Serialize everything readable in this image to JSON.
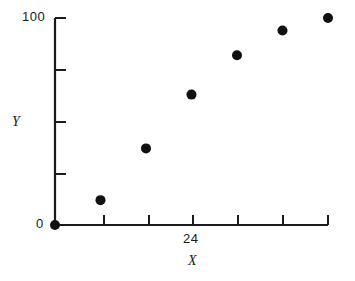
{
  "chart_data": {
    "type": "scatter",
    "title": "",
    "xlabel": "X",
    "ylabel": "Y",
    "xlim": [
      0,
      48
    ],
    "ylim": [
      0,
      100
    ],
    "grid": false,
    "legend": null,
    "x_tick_values": [
      0,
      8,
      16,
      24,
      32,
      40,
      48
    ],
    "x_tick_labels": [
      "",
      "",
      "",
      "24",
      "",
      "",
      ""
    ],
    "y_tick_values": [
      0,
      25,
      50,
      75,
      100
    ],
    "y_tick_labels": [
      "0",
      "",
      "",
      "",
      "100"
    ],
    "x": [
      0,
      8,
      16,
      24,
      32,
      40,
      48
    ],
    "y": [
      0,
      12,
      37,
      63,
      82,
      94,
      100
    ],
    "marker": "filled-circle",
    "marker_color": "#111111",
    "marker_size": 5
  },
  "axis_labels": {
    "y_max": "100",
    "y_min": "0",
    "x_mid": "24",
    "y_title": "Y",
    "x_title": "X"
  },
  "style": {
    "background": "#ffffff",
    "axis_color": "#1a1a1a",
    "point_color": "#111111"
  }
}
